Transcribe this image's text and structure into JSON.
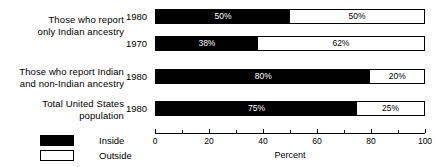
{
  "chart_data": {
    "type": "bar",
    "orientation": "horizontal",
    "stacked": true,
    "normalized_percent": true,
    "title": "",
    "subtitle": "",
    "xlabel": "Percent",
    "ylabel": "",
    "xlim": [
      0,
      100
    ],
    "xticks": [
      0,
      20,
      40,
      60,
      80,
      100
    ],
    "xtick_labels": [
      "0",
      "20",
      "40",
      "60",
      "80",
      "100"
    ],
    "xminor_ticks": [
      10,
      30,
      50,
      70,
      90
    ],
    "grid": false,
    "legend_position": "bottom-left",
    "series": [
      {
        "name": "Inside",
        "color": "#000000",
        "values": [
          50,
          38,
          80,
          75
        ]
      },
      {
        "name": "Outside",
        "color": "#ffffff",
        "values": [
          50,
          62,
          20,
          25
        ]
      }
    ],
    "categories": [
      "Those who report only Indian ancestry, 1980",
      "Those who report only Indian ancestry, 1970",
      "Those who report Indian and non-Indian ancestry, 1980",
      "Total United States population, 1980"
    ],
    "groups": [
      {
        "label": "Those who report\nonly Indian ancestry",
        "rows": [
          {
            "year": "1980",
            "inside": 50,
            "outside": 50,
            "inside_label": "50%",
            "outside_label": "50%"
          },
          {
            "year": "1970",
            "inside": 38,
            "outside": 62,
            "inside_label": "38%",
            "outside_label": "62%"
          }
        ]
      },
      {
        "label": "Those who report Indian\nand non-Indian ancestry",
        "rows": [
          {
            "year": "1980",
            "inside": 80,
            "outside": 20,
            "inside_label": "80%",
            "outside_label": "20%"
          }
        ]
      },
      {
        "label": "Total United States\npopulation",
        "rows": [
          {
            "year": "1980",
            "inside": 75,
            "outside": 25,
            "inside_label": "75%",
            "outside_label": "25%"
          }
        ]
      }
    ]
  },
  "bars": [
    {
      "year": "1980",
      "inside_label": "50%",
      "outside_label": "50%"
    },
    {
      "year": "1970",
      "inside_label": "38%",
      "outside_label": "62%"
    },
    {
      "year": "1980",
      "inside_label": "80%",
      "outside_label": "20%"
    },
    {
      "year": "1980",
      "inside_label": "75%",
      "outside_label": "25%"
    }
  ],
  "group_labels": [
    "Those who report\nonly Indian ancestry",
    "Those who report Indian\nand non-Indian ancestry",
    "Total United States\npopulation"
  ],
  "axis": {
    "title": "Percent",
    "tick_labels": [
      "0",
      "20",
      "40",
      "60",
      "80",
      "100"
    ]
  },
  "legend": {
    "items": [
      {
        "label": "Inside",
        "swatch": "filled-square"
      },
      {
        "label": "Outside",
        "swatch": "hollow-square"
      }
    ]
  }
}
